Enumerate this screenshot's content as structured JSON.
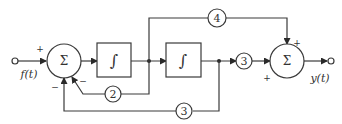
{
  "diagram": {
    "type": "block-diagram",
    "input": {
      "label": "f(t)"
    },
    "output": {
      "label": "y(t)"
    },
    "summers": [
      {
        "id": "sum1",
        "symbol": "Σ",
        "signs": {
          "input": "+",
          "feedback_gain2": "−",
          "feedback_gain3": "−"
        }
      },
      {
        "id": "sum2",
        "symbol": "Σ",
        "signs": {
          "top": "+",
          "left": "+"
        }
      }
    ],
    "integrators": [
      {
        "id": "int1",
        "symbol": "∫"
      },
      {
        "id": "int2",
        "symbol": "∫"
      }
    ],
    "gains": [
      {
        "id": "g2",
        "value": "2",
        "path": "feedback from int1 output to sum1"
      },
      {
        "id": "g3_fb",
        "value": "3",
        "path": "feedback from int2 output to sum1"
      },
      {
        "id": "g3_ff",
        "value": "3",
        "path": "int2 output to sum2"
      },
      {
        "id": "g4",
        "value": "4",
        "path": "feedforward from int1 output to sum2"
      }
    ],
    "colors": {
      "line": "#3a3a3a",
      "text": "#333333",
      "background": "#ffffff"
    }
  }
}
